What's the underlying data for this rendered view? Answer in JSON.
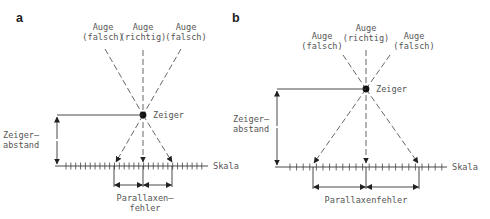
{
  "panels": [
    {
      "id": "a",
      "label": "a",
      "eyes": [
        {
          "line1": "Auge",
          "line2": "(falsch)"
        },
        {
          "line1": "Auge",
          "line2": "(richtig)"
        },
        {
          "line1": "Auge",
          "line2": "(falsch)"
        }
      ],
      "pointer_label": "Zeiger",
      "distance_label_1": "Zeiger–",
      "distance_label_2": "abstand",
      "scale_label": "Skala",
      "error_label_1": "Parallaxen–",
      "error_label_2": "fehler"
    },
    {
      "id": "b",
      "label": "b",
      "eyes": [
        {
          "line1": "Auge",
          "line2": "(falsch)"
        },
        {
          "line1": "Auge",
          "line2": "(richtig)"
        },
        {
          "line1": "Auge",
          "line2": "(falsch)"
        }
      ],
      "pointer_label": "Zeiger",
      "distance_label_1": "Zeiger–",
      "distance_label_2": "abstand",
      "scale_label": "Skala",
      "error_label": "Parallaxenfehler"
    }
  ]
}
